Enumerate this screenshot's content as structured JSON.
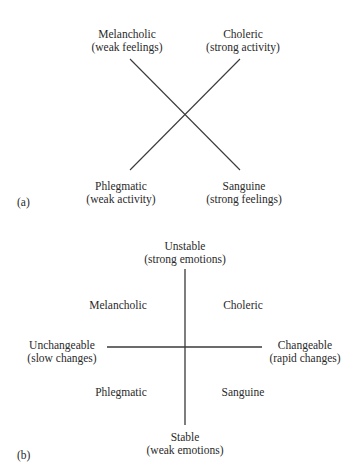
{
  "panel_a": {
    "tag": "(a)",
    "labels": {
      "top_left": {
        "name": "Melancholic",
        "desc": "(weak feelings)"
      },
      "top_right": {
        "name": "Choleric",
        "desc": "(strong activity)"
      },
      "bottom_left": {
        "name": "Phlegmatic",
        "desc": "(weak activity)"
      },
      "bottom_right": {
        "name": "Sanguine",
        "desc": "(strong feelings)"
      }
    }
  },
  "panel_b": {
    "tag": "(b)",
    "axes": {
      "top": {
        "name": "Unstable",
        "desc": "(strong emotions)"
      },
      "bottom": {
        "name": "Stable",
        "desc": "(weak emotions)"
      },
      "left": {
        "name": "Unchangeable",
        "desc": "(slow changes)"
      },
      "right": {
        "name": "Changeable",
        "desc": "(rapid changes)"
      }
    },
    "quadrants": {
      "top_left": "Melancholic",
      "top_right": "Choleric",
      "bottom_left": "Phlegmatic",
      "bottom_right": "Sanguine"
    }
  },
  "caption": ""
}
